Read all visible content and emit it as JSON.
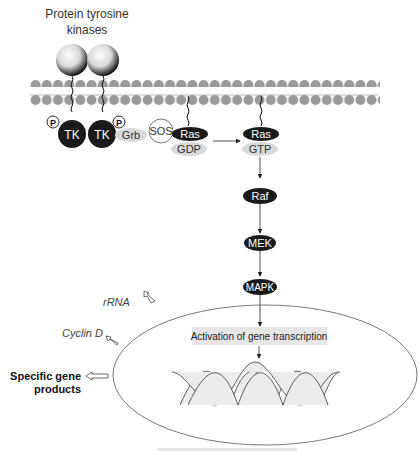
{
  "title": {
    "line1": "Protein tyrosine",
    "line2": "kinases"
  },
  "membrane": {
    "head_color": "#9a9a9a",
    "tail_color": "#bdbdbd"
  },
  "receptors": [
    {
      "label": "TK",
      "phospho": "P"
    },
    {
      "label": "TK",
      "phospho": "P"
    }
  ],
  "adaptors": {
    "grb": "Grb",
    "sos": "SOS"
  },
  "ras_inactive": {
    "label": "Ras",
    "bound": "GDP"
  },
  "ras_active": {
    "label": "Ras",
    "bound": "GTP"
  },
  "cascade": [
    "Raf",
    "MEK",
    "MAPK"
  ],
  "nucleus": {
    "box_label": "Activation of gene transcription"
  },
  "outputs": {
    "rrna": "rRNA",
    "cyclin": "Cyclin D",
    "specific_line1": "Specific gene",
    "specific_line2": "products"
  },
  "colors": {
    "dark": "#1a1a1a",
    "light_ellipse": "#d9d9d9",
    "box_bg": "#e6e6e6",
    "line": "#333333"
  }
}
